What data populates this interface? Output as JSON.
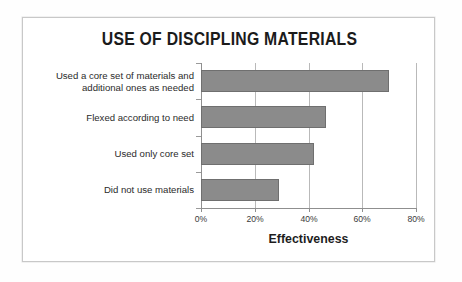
{
  "chart_data": {
    "type": "bar",
    "orientation": "horizontal",
    "title": "USE OF DISCIPLING MATERIALS",
    "xlabel": "Effectiveness",
    "ylabel": "",
    "categories": [
      "Used a core set of materials and additional ones as needed",
      "Flexed according to need",
      "Used only core set",
      "Did not use materials"
    ],
    "category_lines": [
      [
        "Used a core set of materials and",
        "additional ones as needed"
      ],
      [
        "Flexed according to need"
      ],
      [
        "Used only core set"
      ],
      [
        "Did not use materials"
      ]
    ],
    "values": [
      70,
      46.5,
      42,
      29
    ],
    "value_labels": [
      "70%",
      "46.5%",
      "42%",
      "29%"
    ],
    "xlim": [
      0,
      80
    ],
    "xticks": [
      0,
      20,
      40,
      60,
      80
    ],
    "xtick_labels": [
      "0%",
      "20%",
      "40%",
      "60%",
      "80%"
    ],
    "grid": true,
    "legend": false,
    "bar_color": "#8b8b8b",
    "bar_border_color": "#6f6f6f",
    "grid_color": "#b9b9b9",
    "axis_color": "#8f8f8f",
    "frame_color": "#c8c8c8",
    "background": "#ffffff"
  }
}
